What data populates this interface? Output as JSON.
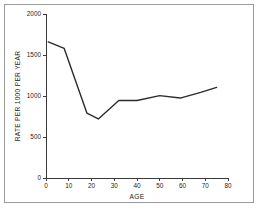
{
  "chart_data": {
    "type": "line",
    "title": "",
    "xlabel": "AGE",
    "ylabel": "RATE PER 1000 PER YEAR",
    "xlim": [
      0,
      80
    ],
    "ylim": [
      0,
      2000
    ],
    "grid": false,
    "legend": null,
    "x_ticks": [
      0,
      10,
      20,
      30,
      40,
      50,
      60,
      70,
      80
    ],
    "y_ticks": [
      0,
      500,
      1000,
      1500,
      2000
    ],
    "x_tick_labels": [
      "0",
      "10",
      "20",
      "30",
      "40",
      "50",
      "60",
      "70",
      "80"
    ],
    "y_tick_labels": [
      "0",
      "500",
      "1000",
      "1500",
      "2000"
    ],
    "series": [
      {
        "name": "rate",
        "x": [
          1,
          8,
          18,
          23,
          32,
          40,
          50,
          59,
          68,
          75
        ],
        "values": [
          1660,
          1580,
          790,
          720,
          945,
          945,
          1005,
          975,
          1045,
          1105
        ]
      }
    ],
    "line_color": "#2b2b2b",
    "axis_color": "#3a3a3a",
    "background_color": "#ffffff",
    "frame_color": "#9a9a9a"
  }
}
